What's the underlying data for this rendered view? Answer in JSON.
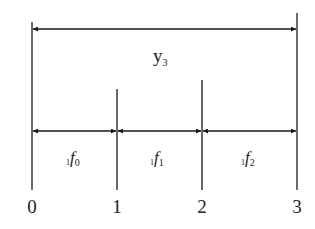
{
  "diagram": {
    "type": "timeline-interval-diagram",
    "colors": {
      "line": "#1a1a1a",
      "text": "#222222",
      "background": "#ffffff"
    },
    "top_span": {
      "label_main": "y",
      "label_sub": "3",
      "from": "0",
      "to": "3"
    },
    "segments": [
      {
        "prefix": "1",
        "main": "f",
        "sub": "0",
        "from": "0",
        "to": "1"
      },
      {
        "prefix": "1",
        "main": "f",
        "sub": "1",
        "from": "1",
        "to": "2"
      },
      {
        "prefix": "1",
        "main": "f",
        "sub": "2",
        "from": "2",
        "to": "3"
      }
    ],
    "ticks": [
      {
        "label": "0"
      },
      {
        "label": "1"
      },
      {
        "label": "2"
      },
      {
        "label": "3"
      }
    ]
  }
}
